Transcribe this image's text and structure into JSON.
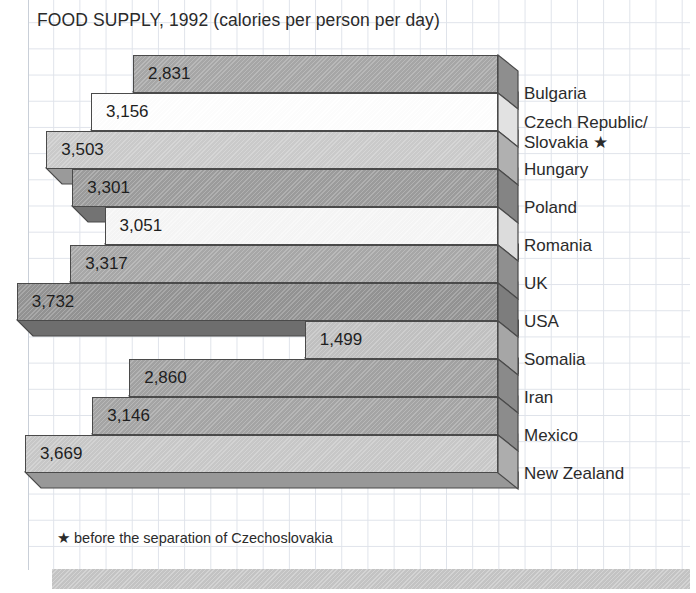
{
  "title": "FOOD SUPPLY, 1992 (calories per person per day)",
  "footnote": "★ before the separation of Czechoslovakia",
  "colors": {
    "outline": "#4a4a4a",
    "grid": "#dfe3ea",
    "band": "#c3c3c3",
    "text": "#2b2b2b"
  },
  "chart_data": {
    "type": "bar",
    "orientation": "horizontal",
    "title": "FOOD SUPPLY, 1992 (calories per person per day)",
    "xlabel": "",
    "ylabel": "",
    "unit": "calories per person per day",
    "year": 1992,
    "note": "★ before the separation of Czechoslovakia",
    "xlim": [
      0,
      4000
    ],
    "grid": true,
    "legend": "none",
    "categories": [
      "Bulgaria",
      "Czech Republic/\nSlovakia ★",
      "Hungary",
      "Poland",
      "Romania",
      "UK",
      "USA",
      "Somalia",
      "Iran",
      "Mexico",
      "New Zealand"
    ],
    "values": [
      2831,
      3156,
      3503,
      3301,
      3051,
      3317,
      3732,
      1499,
      2860,
      3146,
      3669
    ],
    "value_labels": [
      "2,831",
      "3,156",
      "3,503",
      "3,301",
      "3,051",
      "3,317",
      "3,732",
      "1,499",
      "2,860",
      "3,146",
      "3,669"
    ],
    "bars": [
      {
        "label": "Bulgaria",
        "label_line1": "Bulgaria",
        "label_line2": "",
        "value": 2831,
        "value_label": "2,831",
        "fill": "#a8a8a8",
        "side": "#8e8e8e",
        "bottom": "#7c7c7c"
      },
      {
        "label": "Czech Republic/ Slovakia ★",
        "label_line1": "Czech Republic/",
        "label_line2": "Slovakia ★",
        "value": 3156,
        "value_label": "3,156",
        "fill": "#ffffff",
        "side": "#e2e2e2",
        "bottom": "#cfcfcf"
      },
      {
        "label": "Hungary",
        "label_line1": "Hungary",
        "label_line2": "",
        "value": 3503,
        "value_label": "3,503",
        "fill": "#cccccc",
        "side": "#b0b0b0",
        "bottom": "#9a9a9a"
      },
      {
        "label": "Poland",
        "label_line1": "Poland",
        "label_line2": "",
        "value": 3301,
        "value_label": "3,301",
        "fill": "#9d9d9d",
        "side": "#848484",
        "bottom": "#737373"
      },
      {
        "label": "Romania",
        "label_line1": "Romania",
        "label_line2": "",
        "value": 3051,
        "value_label": "3,051",
        "fill": "#f7f7f7",
        "side": "#dcdcdc",
        "bottom": "#c8c8c8"
      },
      {
        "label": "UK",
        "label_line1": "UK",
        "label_line2": "",
        "value": 3317,
        "value_label": "3,317",
        "fill": "#a9a9a9",
        "side": "#8f8f8f",
        "bottom": "#7d7d7d"
      },
      {
        "label": "USA",
        "label_line1": "USA",
        "label_line2": "",
        "value": 3732,
        "value_label": "3,732",
        "fill": "#949494",
        "side": "#7d7d7d",
        "bottom": "#6e6e6e"
      },
      {
        "label": "Somalia",
        "label_line1": "Somalia",
        "label_line2": "",
        "value": 1499,
        "value_label": "1,499",
        "fill": "#c2c2c2",
        "side": "#a6a6a6",
        "bottom": "#929292"
      },
      {
        "label": "Iran",
        "label_line1": "Iran",
        "label_line2": "",
        "value": 2860,
        "value_label": "2,860",
        "fill": "#a3a3a3",
        "side": "#8a8a8a",
        "bottom": "#787878"
      },
      {
        "label": "Mexico",
        "label_line1": "Mexico",
        "label_line2": "",
        "value": 3146,
        "value_label": "3,146",
        "fill": "#a6a6a6",
        "side": "#8c8c8c",
        "bottom": "#7a7a7a"
      },
      {
        "label": "New Zealand",
        "label_line1": "New Zealand",
        "label_line2": "",
        "value": 3669,
        "value_label": "3,669",
        "fill": "#c9c9c9",
        "side": "#adadad",
        "bottom": "#989898"
      }
    ]
  },
  "layout": {
    "bar_right_px": 498,
    "depth_x_px": 20,
    "depth_y_px": 16,
    "row_top_px": 55,
    "row_height_px": 38,
    "px_per_calorie": 0.12895,
    "label_left_px": 524
  }
}
